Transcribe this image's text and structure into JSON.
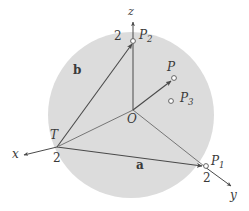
{
  "figure": {
    "colors": {
      "disk_fill": "#dcdcdc",
      "line": "#4a4a4a",
      "marker_stroke": "#555555",
      "marker_fill": "#ffffff",
      "label": "#3a3a3a",
      "background": "#ffffff"
    },
    "disk": {
      "cx": 131,
      "cy": 115,
      "r": 83
    },
    "axes": [
      {
        "name": "z",
        "label": "z"
      },
      {
        "name": "x",
        "label": "x"
      },
      {
        "name": "y",
        "label": "y"
      }
    ],
    "labels": {
      "z_axis": "z",
      "x_axis": "x",
      "y_axis": "y",
      "origin": "O",
      "vector_a": "a",
      "vector_b": "b",
      "point_T": "T",
      "point_P": "P",
      "point_P1_base": "P",
      "point_P1_sub": "1",
      "point_P2_base": "P",
      "point_P2_sub": "2",
      "point_P3_base": "P",
      "point_P3_sub": "3",
      "tick_z": "2",
      "tick_x": "2",
      "tick_y": "2"
    },
    "points": [
      {
        "name": "O",
        "label": "O",
        "x": 133,
        "y": 110,
        "marker": "none"
      },
      {
        "name": "P1",
        "label": "P1",
        "x": 205,
        "y": 167,
        "marker": "open-circle"
      },
      {
        "name": "P2",
        "label": "P2",
        "x": 133,
        "y": 41,
        "marker": "open-circle"
      },
      {
        "name": "P3",
        "label": "P3",
        "x": 171,
        "y": 101,
        "marker": "open-circle"
      },
      {
        "name": "P",
        "label": "P",
        "x": 173,
        "y": 78,
        "marker": "open-circle"
      },
      {
        "name": "T",
        "label": "T",
        "x": 57,
        "y": 147,
        "marker": "none"
      }
    ],
    "vectors": [
      {
        "name": "a",
        "label": "a",
        "from": "T",
        "to": "P1"
      },
      {
        "name": "b",
        "label": "b",
        "from": "T",
        "to": "P2"
      },
      {
        "name": "OP",
        "label": "P",
        "from": "O",
        "to": "P"
      }
    ]
  }
}
